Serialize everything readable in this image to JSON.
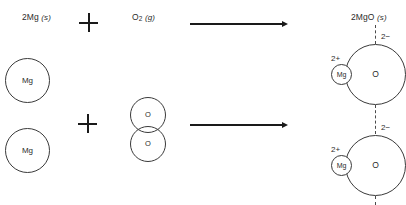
{
  "diagram": {
    "equation_text": "2Mg (s) + O2 (g) -> 2MgO (s)",
    "colors": {
      "ink": "#231f20",
      "stroke": "#3a3a3a",
      "background": "#ffffff",
      "dashed": "#4a4a4a"
    }
  },
  "reactants": {
    "magnesium": {
      "formula_prefix": "2Mg",
      "formula_sub": "",
      "state": "(s)",
      "label_full": "2Mg (s)",
      "atoms": [
        {
          "symbol": "Mg"
        },
        {
          "symbol": "Mg"
        }
      ]
    },
    "oxygen": {
      "formula_prefix": "O",
      "formula_sub": "2",
      "state": "(g)",
      "label_full": "O2 (g)",
      "atoms": [
        {
          "symbol": "O"
        },
        {
          "symbol": "O"
        }
      ]
    },
    "plus_signs": [
      {
        "glyph": "+"
      },
      {
        "glyph": "+"
      }
    ]
  },
  "arrows": [
    {
      "direction": "right",
      "glyph": "→"
    },
    {
      "direction": "right",
      "glyph": "→"
    }
  ],
  "products": {
    "magnesium_oxide": {
      "formula_prefix": "2MgO",
      "state": "(s)",
      "label_full": "2MgO (s)",
      "units": [
        {
          "cation": {
            "symbol": "Mg",
            "charge": "2+"
          },
          "anion": {
            "symbol": "O",
            "charge": "2−"
          }
        },
        {
          "cation": {
            "symbol": "Mg",
            "charge": "2+"
          },
          "anion": {
            "symbol": "O",
            "charge": "2−"
          }
        }
      ]
    }
  }
}
